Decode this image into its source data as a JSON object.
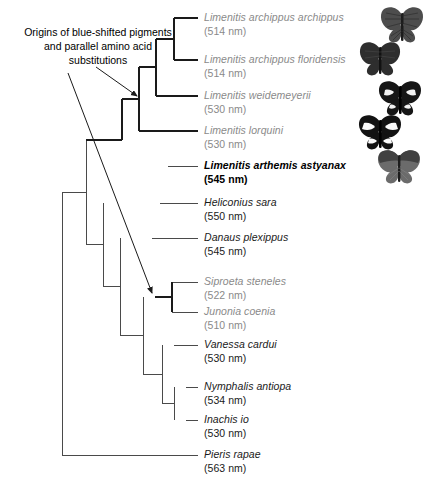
{
  "figure": {
    "type": "phylogenetic-tree",
    "annotation": "Origins of blue-shifted pigments and parallel amino acid substitutions",
    "annotation_lines": [
      "Origins of blue-shifted pigments",
      "and parallel amino acid",
      "substitutions"
    ],
    "colors": {
      "muted_text": "#8a8a8a",
      "normal_text": "#1a1a1a",
      "highlight_text": "#000000",
      "branch": "#4a4a4a",
      "branch_bold": "#1a1a1a",
      "background": "#ffffff"
    }
  },
  "taxa": [
    {
      "id": "limenitis-archippus-archippus",
      "name": "Limenitis archippus archippus",
      "peak": "(514 nm)",
      "peak_nm": 514,
      "style": "muted",
      "y": 18
    },
    {
      "id": "limenitis-archippus-floridensis",
      "name": "Limenitis archippus floridensis",
      "peak": "(514 nm)",
      "peak_nm": 514,
      "style": "muted",
      "y": 60
    },
    {
      "id": "limenitis-weidemeyerii",
      "name": "Limenitis weidemeyerii",
      "peak": "(530 nm)",
      "peak_nm": 530,
      "style": "muted",
      "y": 96
    },
    {
      "id": "limenitis-lorquini",
      "name": "Limenitis lorquini",
      "peak": "(530 nm)",
      "peak_nm": 530,
      "style": "muted",
      "y": 131
    },
    {
      "id": "limenitis-arthemis-astyanax",
      "name": "Limenitis arthemis astyanax",
      "peak": "(545 nm)",
      "peak_nm": 545,
      "style": "highlight",
      "y": 166
    },
    {
      "id": "heliconius-sara",
      "name": "Heliconius sara",
      "peak": "(550 nm)",
      "peak_nm": 550,
      "style": "normal",
      "y": 203
    },
    {
      "id": "danaus-plexippus",
      "name": "Danaus plexippus",
      "peak": "(545 nm)",
      "peak_nm": 545,
      "style": "normal",
      "y": 238
    },
    {
      "id": "siproeta-steneles",
      "name": "Siproeta steneles",
      "peak": "(522 nm)",
      "peak_nm": 522,
      "style": "muted",
      "y": 282
    },
    {
      "id": "junonia-coenia",
      "name": "Junonia coenia",
      "peak": "(510 nm)",
      "peak_nm": 510,
      "style": "muted",
      "y": 312
    },
    {
      "id": "vanessa-cardui",
      "name": "Vanessa cardui",
      "peak": "(530 nm)",
      "peak_nm": 530,
      "style": "normal",
      "y": 345
    },
    {
      "id": "nymphalis-antiopa",
      "name": "Nymphalis antiopa",
      "peak": "(534 nm)",
      "peak_nm": 534,
      "style": "normal",
      "y": 387
    },
    {
      "id": "inachis-io",
      "name": "Inachis io",
      "peak": "(530 nm)",
      "peak_nm": 530,
      "style": "normal",
      "y": 420
    },
    {
      "id": "pieris-rapae",
      "name": "Pieris rapae",
      "peak": "(563 nm)",
      "peak_nm": 563,
      "style": "normal",
      "y": 455
    }
  ],
  "specimens": [
    {
      "id": "specimen-1",
      "label": "butterfly-photo-1"
    },
    {
      "id": "specimen-2",
      "label": "butterfly-photo-2"
    },
    {
      "id": "specimen-3",
      "label": "butterfly-photo-3"
    },
    {
      "id": "specimen-4",
      "label": "butterfly-photo-4"
    },
    {
      "id": "specimen-5",
      "label": "butterfly-photo-5"
    }
  ]
}
